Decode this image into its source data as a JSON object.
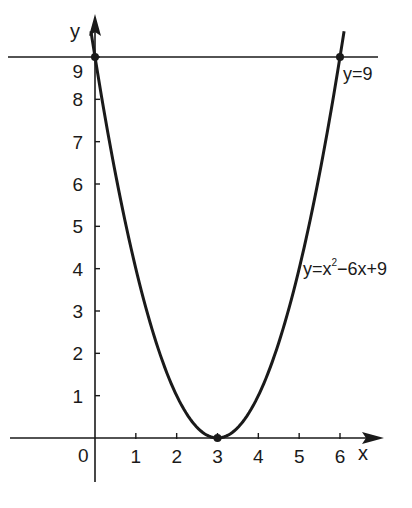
{
  "chart_data": {
    "type": "line",
    "title": "",
    "xlabel": "x",
    "ylabel": "y",
    "xlim": [
      0,
      6
    ],
    "ylim": [
      0,
      9
    ],
    "grid": false,
    "x_ticks": [
      0,
      1,
      2,
      3,
      4,
      5,
      6
    ],
    "y_ticks": [
      1,
      2,
      3,
      4,
      5,
      6,
      7,
      8,
      9
    ],
    "origin_label": "0",
    "series": [
      {
        "name": "y=x²−6x+9",
        "equation": "y = x^2 - 6x + 9",
        "x": [
          -0.1,
          0,
          0.5,
          1,
          1.5,
          2,
          2.5,
          3,
          3.5,
          4,
          4.5,
          5,
          5.5,
          6,
          6.1
        ],
        "values": [
          9.61,
          9,
          6.25,
          4,
          2.25,
          1,
          0.25,
          0,
          0.25,
          1,
          2.25,
          4,
          6.25,
          9,
          9.61
        ]
      },
      {
        "name": "y=9",
        "equation": "y = 9",
        "x": [
          -2.1,
          6.9
        ],
        "values": [
          9,
          9
        ]
      }
    ],
    "points": [
      {
        "x": 0,
        "y": 9,
        "label": ""
      },
      {
        "x": 3,
        "y": 0,
        "label": ""
      },
      {
        "x": 6,
        "y": 9,
        "label": ""
      }
    ],
    "annotations": [
      {
        "text": "y=9",
        "near": "line y=9, right end"
      },
      {
        "text": "y=x²−6x+9",
        "near": "parabola, right branch"
      }
    ]
  },
  "labels": {
    "x_axis": "x",
    "y_axis": "y",
    "origin": "0",
    "line_label": "y=9",
    "parabola_label_base": "y=x",
    "parabola_label_sup": "2",
    "parabola_label_rest": "−6x+9",
    "x_tick_labels": [
      "1",
      "2",
      "3",
      "4",
      "5",
      "6"
    ],
    "y_tick_labels": [
      "1",
      "2",
      "3",
      "4",
      "5",
      "6",
      "7",
      "8",
      "9"
    ]
  },
  "colors": {
    "ink": "#1a1a1a",
    "background": "#ffffff"
  }
}
